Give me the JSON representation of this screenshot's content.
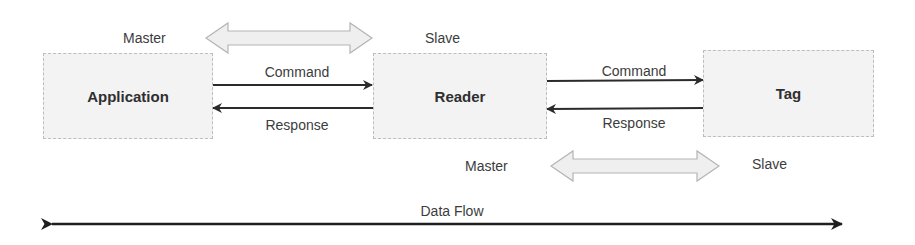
{
  "diagram": {
    "nodes": [
      {
        "id": "application",
        "label": "Application"
      },
      {
        "id": "reader",
        "label": "Reader"
      },
      {
        "id": "tag",
        "label": "Tag"
      }
    ],
    "links": [
      {
        "from": "application",
        "to": "reader",
        "command_label": "Command",
        "response_label": "Response"
      },
      {
        "from": "reader",
        "to": "tag",
        "command_label": "Command",
        "response_label": "Response"
      }
    ],
    "roles": {
      "top": {
        "master": "Master",
        "slave": "Slave"
      },
      "bottom": {
        "master": "Master",
        "slave": "Slave"
      }
    },
    "data_flow_label": "Data Flow",
    "colors": {
      "box_fill": "#f3f3f3",
      "box_border": "#bdbdbd",
      "arrow": "#2b2b2b",
      "double_arrow_fill": "#efefef",
      "double_arrow_stroke": "#b5b5b5"
    }
  }
}
